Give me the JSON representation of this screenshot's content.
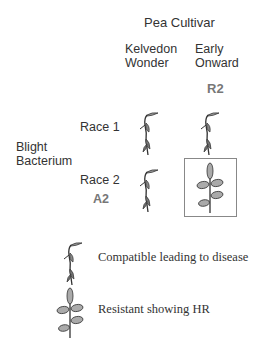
{
  "title": "Pea Cultivar",
  "cultivars": [
    {
      "name_line1": "Kelvedon",
      "name_line2": "Wonder",
      "gene": ""
    },
    {
      "name_line1": "Early",
      "name_line2": "Onward",
      "gene": "R2"
    }
  ],
  "pathogen": {
    "line1": "Blight",
    "line2": "Bacterium"
  },
  "races": [
    {
      "label": "Race 1",
      "avr": ""
    },
    {
      "label": "Race 2",
      "avr": "A2"
    }
  ],
  "grid": [
    [
      "compatible",
      "compatible"
    ],
    [
      "compatible",
      "resistant"
    ]
  ],
  "legend": [
    {
      "icon": "wilted-plant-icon",
      "label": "Compatible leading to disease"
    },
    {
      "icon": "healthy-plant-icon",
      "label": "Resistant showing HR"
    }
  ],
  "colors": {
    "text": "#333333",
    "gene_label": "#777777",
    "leaf_fill": "#aaaaaa",
    "box_border": "#888888"
  }
}
